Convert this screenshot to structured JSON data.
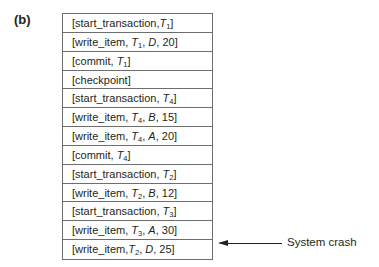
{
  "figure": {
    "label": "(b)",
    "log_entries": [
      {
        "op": "start_transaction",
        "args": [
          {
            "t": "T",
            "s": "1"
          }
        ]
      },
      {
        "op": "write_item",
        "args": [
          {
            "t": "T",
            "s": "1"
          },
          {
            "v": "D",
            "i": true
          },
          {
            "v": "20"
          }
        ]
      },
      {
        "op": "commit",
        "args": [
          {
            "t": "T",
            "s": "1"
          }
        ]
      },
      {
        "op": "checkpoint",
        "args": []
      },
      {
        "op": "start_transaction",
        "args": [
          {
            "t": "T",
            "s": "4"
          }
        ]
      },
      {
        "op": "write_item",
        "args": [
          {
            "t": "T",
            "s": "4"
          },
          {
            "v": "B",
            "i": true
          },
          {
            "v": "15"
          }
        ]
      },
      {
        "op": "write_item",
        "args": [
          {
            "t": "T",
            "s": "4"
          },
          {
            "v": "A",
            "i": true
          },
          {
            "v": "20"
          }
        ]
      },
      {
        "op": "commit",
        "args": [
          {
            "t": "T",
            "s": "4"
          }
        ]
      },
      {
        "op": "start_transaction",
        "args": [
          {
            "t": "T",
            "s": "2"
          }
        ]
      },
      {
        "op": "write_item",
        "args": [
          {
            "t": "T",
            "s": "2"
          },
          {
            "v": "B",
            "i": true
          },
          {
            "v": "12"
          }
        ]
      },
      {
        "op": "start_transaction",
        "args": [
          {
            "t": "T",
            "s": "3"
          }
        ]
      },
      {
        "op": "write_item",
        "args": [
          {
            "t": "T",
            "s": "3"
          },
          {
            "v": "A",
            "i": true
          },
          {
            "v": "30"
          }
        ]
      },
      {
        "op": "write_item",
        "args": [
          {
            "t": "T",
            "s": "2"
          },
          {
            "v": "D",
            "i": true
          },
          {
            "v": "25"
          }
        ]
      }
    ],
    "log_text": [
      "[start_transaction,T1]",
      "[write_item, T1, D, 20]",
      "[commit, T1]",
      "[checkpoint]",
      "[start_transaction, T4]",
      "[write_item, T4, B, 15]",
      "[write_item, T4, A, 20]",
      "[commit, T4]",
      "[start_transaction, T2]",
      "[write_item, T2, B, 12]",
      "[start_transaction, T3]",
      "[write_item, T3, A, 30]",
      "[write_item,T2, D, 25]"
    ],
    "annotation": {
      "text": "System crash",
      "points_to_row": 12
    }
  }
}
